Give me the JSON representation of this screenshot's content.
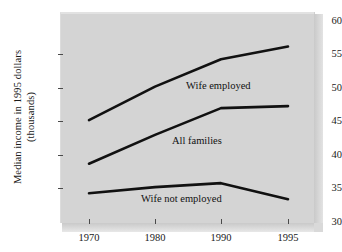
{
  "chart_data": {
    "type": "line",
    "title": "",
    "xlabel": "",
    "ylabel": "Median income in 1995 dollars (thousands)",
    "ylabel_line1": "Median income in 1995 dollars",
    "ylabel_line2": "(thousands)",
    "x": [
      1970,
      1980,
      1990,
      1995
    ],
    "xtick_labels": [
      "1970",
      "1980",
      "1990",
      "1995"
    ],
    "ytick_labels": [
      "30",
      "35",
      "40",
      "45",
      "50",
      "55",
      "60"
    ],
    "yticks": [
      30,
      35,
      40,
      45,
      50,
      55,
      60
    ],
    "ylim": [
      30,
      60
    ],
    "xlim": [
      1966,
      1999
    ],
    "grid": false,
    "legend_position": "inline-annotations",
    "line_color": "#111111",
    "plot_background": "#d4d4d4",
    "series": [
      {
        "name": "Wife employed",
        "values": [
          45.2,
          50.2,
          54.3,
          56.2
        ],
        "label": "Wife employed",
        "label_x": 186,
        "label_y": 80
      },
      {
        "name": "All families",
        "values": [
          38.7,
          43.0,
          47.0,
          47.3
        ],
        "label": "All families",
        "label_x": 172,
        "label_y": 135
      },
      {
        "name": "Wife not employed",
        "values": [
          34.3,
          35.2,
          35.8,
          33.4
        ],
        "label": "Wife not employed",
        "label_x": 141,
        "label_y": 193
      }
    ]
  },
  "axis": {
    "y_tick_positions_px": [
      222,
      188.5,
      155,
      121.5,
      88,
      54.5,
      21
    ],
    "x_tick_positions_px": [
      89,
      155,
      221,
      288
    ]
  }
}
